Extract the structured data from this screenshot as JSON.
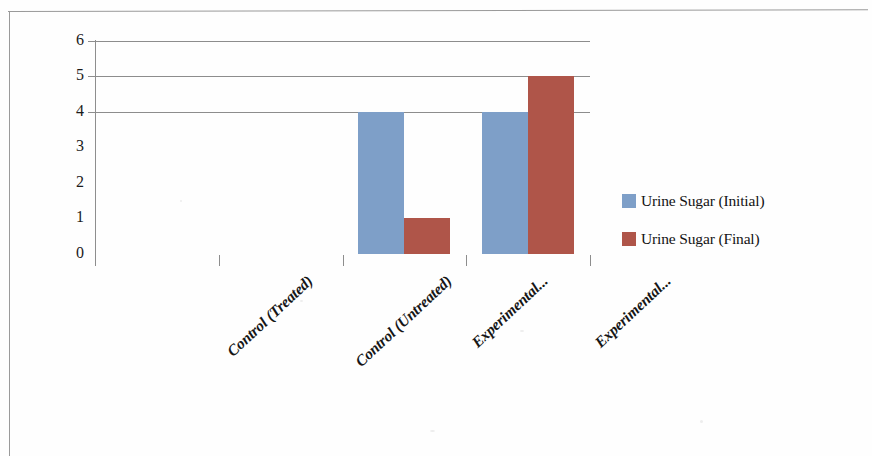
{
  "chart_data": {
    "type": "bar",
    "title": "",
    "subtitle": "",
    "xlabel": "",
    "ylabel": "",
    "categories": [
      "Control (Treated)",
      "Control (Untreated)",
      "Experimental...",
      "Experimental..."
    ],
    "series": [
      {
        "name": "Urine Sugar (Initial)",
        "color": "#7E9FC8",
        "values": [
          0,
          0,
          4,
          4
        ]
      },
      {
        "name": "Urine Sugar (Final)",
        "color": "#AF5549",
        "values": [
          0,
          0,
          1,
          5
        ]
      }
    ],
    "ylim": [
      0,
      6
    ],
    "ytick_labels": [
      "6",
      "5",
      "4",
      "3",
      "2",
      "1",
      "0"
    ],
    "ytick_values": [
      6,
      5,
      4,
      3,
      2,
      1,
      0
    ],
    "gridlines_at": [
      6,
      5,
      4
    ],
    "grid": true,
    "legend_position": "right",
    "annotations": [],
    "axis_color": "#8d8d8d",
    "background_color": "#ffffff"
  },
  "legend": {
    "entries": [
      {
        "label": "Urine Sugar (Initial)",
        "color": "#7E9FC8"
      },
      {
        "label": "Urine Sugar (Final)",
        "color": "#AF5549"
      }
    ]
  },
  "axis": {
    "y_labels": [
      "6",
      "5",
      "4",
      "3",
      "2",
      "1",
      "0"
    ],
    "x_labels": [
      "Control (Treated)",
      "Control (Untreated)",
      "Experimental...",
      "Experimental..."
    ]
  }
}
